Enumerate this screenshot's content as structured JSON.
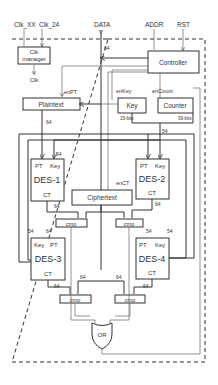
{
  "inputs": {
    "clk_xx": "Clk_XX",
    "clk_24": "Clk_24",
    "data": "DATA",
    "addr": "ADDR",
    "rst": "RST"
  },
  "blocks": {
    "clk_manager_line1": "Clk",
    "clk_manager_line2": "manager",
    "clk_out": "Clk",
    "controller": "Controller",
    "plaintext": "Plaintext",
    "key": "Key",
    "counter": "Counter",
    "ciphertext": "Ciphertext",
    "or_gate": "OR",
    "cmp": "cmp"
  },
  "signals": {
    "enPT": "enPT",
    "enKey": "enKey",
    "enCount": "enCount",
    "enCT": "enCT",
    "key_bits": "15-bits",
    "counter_bits": "39-bits"
  },
  "des": [
    {
      "name": "DES-1",
      "pt": "PT",
      "key": "Key",
      "ct": "CT"
    },
    {
      "name": "DES-2",
      "pt": "PT",
      "key": "Key",
      "ct": "CT"
    },
    {
      "name": "DES-3",
      "pt": "PT",
      "key": "Key",
      "ct": "CT"
    },
    {
      "name": "DES-4",
      "pt": "PT",
      "key": "Key",
      "ct": "CT"
    }
  ],
  "bus_width": {
    "w64": "64",
    "w54": "54"
  }
}
